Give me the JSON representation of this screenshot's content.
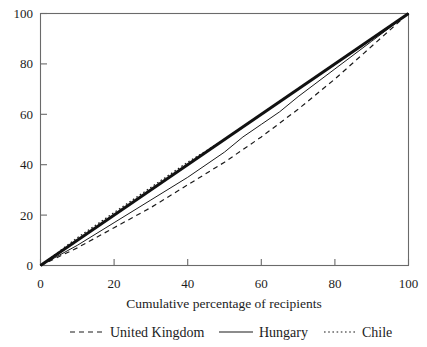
{
  "chart_data": {
    "type": "line",
    "title": "",
    "subtitle": "",
    "xlabel": "Cumulative percentage of recipients",
    "ylabel": "",
    "xlim": [
      0,
      100
    ],
    "ylim": [
      0,
      100
    ],
    "grid": false,
    "legend_position": "bottom",
    "xticks": [
      0,
      20,
      40,
      60,
      80,
      100
    ],
    "yticks": [
      0,
      20,
      40,
      60,
      80,
      100
    ],
    "xtick_labels": [
      "0",
      "20",
      "40",
      "60",
      "80",
      "100"
    ],
    "ytick_labels": [
      "0",
      "20",
      "40",
      "60",
      "80",
      "100"
    ],
    "series": [
      {
        "name": "United Kingdom",
        "style": "dashed",
        "color": "#1a1a1a",
        "x": [
          0,
          10,
          20,
          30,
          40,
          50,
          60,
          70,
          80,
          90,
          100
        ],
        "values": [
          0,
          7,
          15,
          23,
          32,
          41,
          51,
          62,
          74,
          87,
          100
        ]
      },
      {
        "name": "Hungary",
        "style": "solid",
        "color": "#1a1a1a",
        "x": [
          0,
          10,
          20,
          30,
          40,
          50,
          55,
          60,
          65,
          70,
          80,
          90,
          100
        ],
        "values": [
          0,
          8,
          17,
          26,
          35,
          45,
          51,
          56,
          61,
          67,
          78,
          89,
          100
        ]
      },
      {
        "name": "Chile",
        "style": "dotted",
        "color": "#1a1a1a",
        "x": [
          0,
          10,
          20,
          30,
          40,
          50,
          60,
          70,
          80,
          90,
          100
        ],
        "values": [
          0,
          11,
          21,
          31,
          41,
          50,
          60,
          70,
          80,
          90,
          100
        ]
      },
      {
        "name": "Line of equality",
        "style": "thick-solid",
        "color": "#111111",
        "x": [
          0,
          100
        ],
        "values": [
          0,
          100
        ]
      }
    ],
    "legend_entries": [
      {
        "label": "United Kingdom",
        "style": "dashed"
      },
      {
        "label": "Hungary",
        "style": "solid"
      },
      {
        "label": "Chile",
        "style": "dotted"
      }
    ]
  },
  "axes": {
    "x_title": "Cumulative percentage of recipients",
    "x_tick_0": "0",
    "x_tick_1": "20",
    "x_tick_2": "40",
    "x_tick_3": "60",
    "x_tick_4": "80",
    "x_tick_5": "100",
    "y_tick_0": "0",
    "y_tick_1": "20",
    "y_tick_2": "40",
    "y_tick_3": "60",
    "y_tick_4": "80",
    "y_tick_5": "100"
  },
  "legend": {
    "item_uk": "United Kingdom",
    "item_hungary": "Hungary",
    "item_chile": "Chile"
  }
}
